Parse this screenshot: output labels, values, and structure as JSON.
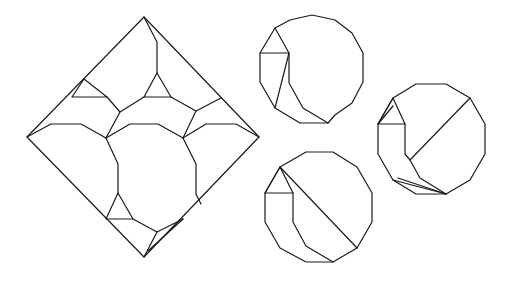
{
  "diagram": {
    "stroke_color": "#1a1a1a",
    "background_color": "#ffffff",
    "figures": [
      {
        "name": "diamond-dissection",
        "paths": [
          "M144,17 L259,137 L144,257 L27,137 Z",
          "M144,17 L157,42 L157,73",
          "M157,73 L144,97 L171,97 Z",
          "M144,97 L120,112 L107,97",
          "M171,97 L196,111 L221,98",
          "M84,79 L72,97 L107,97 Z",
          "M120,112 L106,138",
          "M196,111 L183,138",
          "M27,137 L51,124 L81,124 L106,138",
          "M106,138 L130,124 L158,124 L183,138",
          "M183,138 L206,124 L236,124 L259,137",
          "M106,138 L118,164 L118,193",
          "M183,138 L196,164 L196,194 L201,204",
          "M118,193 L106,219 L133,219 Z",
          "M133,219 L157,232 L183,219",
          "M157,232 L144,257",
          "M183,219 L148,251"
        ]
      },
      {
        "name": "dodecagon-top",
        "paths": [
          "M290,20 L312,15 L335,20 L352,33 L363,53 L363,82 L352,103 L335,115 L328,123 L300,123 L275,108 L260,82 L260,53 L275,28 Z",
          "M260,53 L289,53",
          "M275,28 L289,53 L289,83 L303,108 L328,123",
          "M289,53 L275,108"
        ]
      },
      {
        "name": "dodecagon-right",
        "paths": [
          "M393,98 L416,84 L446,84 L470,98 L485,124 L485,154 L470,180 L446,194 L416,194 L393,180 L378,154 L378,124 Z",
          "M378,124 L393,98 L405,124 Z",
          "M378,124 L393,106",
          "M405,124 L405,154 L410,160 L470,98",
          "M410,160 L420,178 L446,194",
          "M393,180 L446,194",
          "M398,178 L446,194"
        ]
      },
      {
        "name": "dodecagon-bottom",
        "paths": [
          "M280,167 L306,152 L333,152 L357,167 L372,193 L372,222 L357,248 L333,262 L306,262 L280,248 L265,222 L265,193 Z",
          "M265,193 L280,167 L293,193 Z",
          "M280,167 L357,248",
          "M293,193 L293,222 L306,246 L333,262"
        ]
      }
    ]
  }
}
